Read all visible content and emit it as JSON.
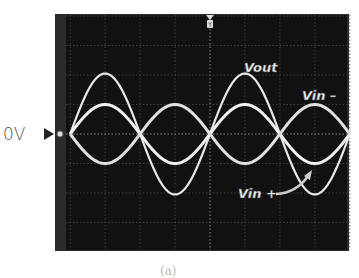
{
  "chart_data": {
    "type": "line",
    "title": "",
    "xlabel": "",
    "ylabel": "",
    "ground_marker_label": "0V",
    "trigger_marker": "T",
    "caption": "(a)",
    "x_unit": "divisions",
    "y_unit": "divisions",
    "xlim": [
      -4,
      4
    ],
    "ylim": [
      -4,
      4
    ],
    "grid": true,
    "period_div": 4,
    "phase_start_div": -4,
    "series": [
      {
        "name": "Vout",
        "label": "Vout",
        "amplitude_div": 2.05,
        "phase": "in-phase",
        "color": "#e8e8e8"
      },
      {
        "name": "Vin-",
        "label": "Vin –",
        "amplitude_div": 1.0,
        "phase": "in-phase",
        "color": "#f0f0f0"
      },
      {
        "name": "Vin+",
        "label": "Vin +",
        "amplitude_div": 1.0,
        "phase": "inverted",
        "color": "#e0e0e0"
      }
    ],
    "annotations": [
      {
        "text": "Vout",
        "near": "second Vout peak"
      },
      {
        "text": "Vin –",
        "near": "last Vin– peak"
      },
      {
        "text": "Vin +",
        "near": "arrow pointing to Vin+ trough"
      }
    ]
  }
}
